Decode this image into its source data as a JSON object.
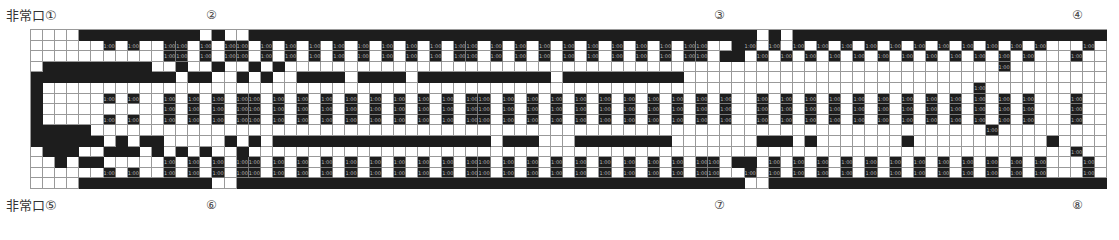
{
  "labels": {
    "exit_1": "非常口①",
    "exit_5": "非常口⑤",
    "marker_2": "②",
    "marker_3": "③",
    "marker_4": "④",
    "marker_6": "⑥",
    "marker_7": "⑦",
    "marker_8": "⑧"
  },
  "seat_label": "1:00",
  "legend": {
    ".": "empty",
    "#": "wall",
    "S": "seat (1:00)"
  },
  "grid_rows": [
    "....##########.#..##########################################.#.###########################..#",
    "......S.S..SS.S.SS.S.S.S.S.S.S.S.S.SS.S.S.S.S.S.S.S.S.SS..#S.S.S.S.S.S.S.S.S.S.S.S.S...S",
    "...........SS.S.SS.S.S.S.S.S.S.S.S.SS.S.S.S.S.S.S.S.S.SS.##.S.S.S.S.S.S.S.S.S.S.S.S...S",
    ".#########..#..#..#.#...........................................................S",
    "############.##..#.#..####.####.###########.##########.....................................S",
    "#.............................................................................S",
    "#.....S.S..S.S.S.SS.S.S.S.S.S.S.S.S.SS.S.S.S.S.S.S.S.S.S.S..S.S.S.S.S.S.S.S.S.S.S.S...S",
    "#..........S.S.S.SS.S.S.S.S.S.S.S.S.SS.S.S.S.S.S.S.S.S.S.S..S.S.S.S.S.S.S.S.S.S.S.S...S",
    "#.....S.S..S.S.S.SS.S.S.S.S.S.S.S.S.SS.S.S.S.S.S.S.S.S.S.S..S.S.S.S.S.S.S.S.S.S.S.S...S",
    "#####..........................................................................S",
    "######.#.##.....#.#.##################.###...########.......###.#.......#...........#....S",
    ".###..###.#.#.#..#....................................................................S",
    "..#.##.....S.S.S.SS.S.S.S.S.S.S.S.S.SS.S.S.S.S.S.S.S.S.SS.##.S.S.S.S.S.S.S.S.S.S.S.S...S",
    "......S.S..S.S.S.SS.S.S.S.S.S.S.S.S.SS.S.S.S.S.S.S.S.S.SS..S.S.S.S.S.S.S.S.S.S.S.S.S...S",
    "....###########..##########################################..############################..#"
  ]
}
